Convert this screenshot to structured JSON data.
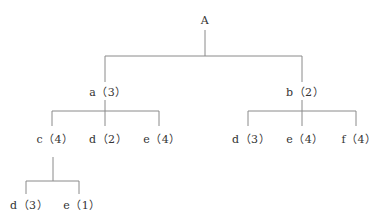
{
  "tree": {
    "root": {
      "label": "A"
    },
    "level1": [
      {
        "label": "a（3）"
      },
      {
        "label": "b（2）"
      }
    ],
    "level2_a": [
      {
        "label": "c（4）"
      },
      {
        "label": "d（2）"
      },
      {
        "label": "e（4）"
      }
    ],
    "level2_b": [
      {
        "label": "d（3）"
      },
      {
        "label": "e（4）"
      },
      {
        "label": "f（4）"
      }
    ],
    "level3_c": [
      {
        "label": "d（3）"
      },
      {
        "label": "e（1）"
      }
    ]
  },
  "colors": {
    "line": "#888888",
    "text": "#333333"
  }
}
